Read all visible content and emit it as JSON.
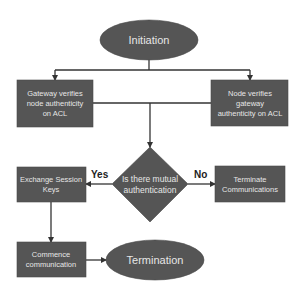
{
  "diagram": {
    "type": "flowchart",
    "colors": {
      "shape_fill": "#555555",
      "shape_text": "#e6e6e6",
      "edge": "#333333",
      "background": "#ffffff"
    },
    "nodes": {
      "initiation": {
        "shape": "ellipse",
        "label": "Initiation"
      },
      "gateway_verifies": {
        "shape": "rect",
        "lines": [
          "Gateway verifies",
          "node authenticity",
          "on ACL"
        ]
      },
      "node_verifies": {
        "shape": "rect",
        "lines": [
          "Node verifies",
          "gateway",
          "authenticity on ACL"
        ]
      },
      "decision": {
        "shape": "diamond",
        "lines": [
          "Is there mutual",
          "authentication"
        ]
      },
      "exchange_keys": {
        "shape": "rect",
        "lines": [
          "Exchange Session",
          "Keys"
        ]
      },
      "terminate_comm": {
        "shape": "rect",
        "lines": [
          "Terminate",
          "Communications"
        ]
      },
      "commence_comm": {
        "shape": "rect",
        "lines": [
          "Commence",
          "communication"
        ]
      },
      "termination": {
        "shape": "ellipse",
        "label": "Termination"
      }
    },
    "edges": {
      "yes_label": "Yes",
      "no_label": "No",
      "list": [
        {
          "from": "initiation",
          "to": "gateway_verifies"
        },
        {
          "from": "initiation",
          "to": "node_verifies"
        },
        {
          "from": "gateway_verifies",
          "to": "decision"
        },
        {
          "from": "node_verifies",
          "to": "decision"
        },
        {
          "from": "decision",
          "to": "exchange_keys",
          "label": "Yes"
        },
        {
          "from": "decision",
          "to": "terminate_comm",
          "label": "No"
        },
        {
          "from": "exchange_keys",
          "to": "commence_comm"
        },
        {
          "from": "commence_comm",
          "to": "termination"
        }
      ]
    }
  }
}
